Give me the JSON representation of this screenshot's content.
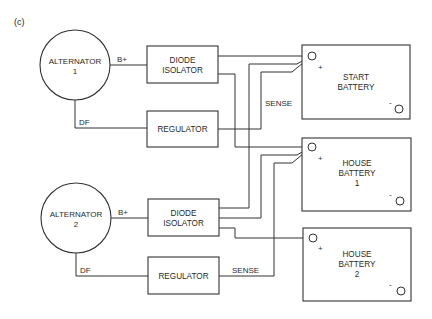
{
  "figure_label": "(c)",
  "colors": {
    "line": "#333333",
    "text": "#2a2a2a",
    "background": "#ffffff"
  },
  "alternators": [
    {
      "line1": "ALTERNATOR",
      "line2": "1",
      "bplus_label": "B+",
      "df_label": "DF"
    },
    {
      "line1": "ALTERNATOR",
      "line2": "2",
      "bplus_label": "B+",
      "df_label": "DF"
    }
  ],
  "diode_isolators": [
    {
      "line1": "DIODE",
      "line2": "ISOLATOR"
    },
    {
      "line1": "DIODE",
      "line2": "ISOLATOR"
    }
  ],
  "regulators": [
    {
      "label": "REGULATOR",
      "sense_label": "SENSE"
    },
    {
      "label": "REGULATOR",
      "sense_label": "SENSE"
    }
  ],
  "batteries": [
    {
      "line1": "START",
      "line2": "BATTERY",
      "line3": "",
      "plus": "+",
      "minus": "-"
    },
    {
      "line1": "HOUSE",
      "line2": "BATTERY",
      "line3": "1",
      "plus": "+",
      "minus": "-"
    },
    {
      "line1": "HOUSE",
      "line2": "BATTERY",
      "line3": "2",
      "plus": "+",
      "minus": "-"
    }
  ]
}
